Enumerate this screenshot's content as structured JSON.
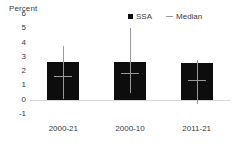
{
  "chart_data": {
    "type": "bar",
    "title": "",
    "subtitle": "",
    "xlabel": "",
    "ylabel": "Percent",
    "ylim": [
      -1,
      6
    ],
    "yticks": [
      6,
      5,
      4,
      3,
      2,
      1,
      0,
      -1
    ],
    "ytick_labels": [
      "6",
      "5",
      "4",
      "3",
      "2",
      "1",
      "0",
      "-1"
    ],
    "grid": false,
    "legend_position": "top-right",
    "categories": [
      "2000-21",
      "2000-10",
      "2011-21"
    ],
    "series": [
      {
        "name": "SSA",
        "type": "bar",
        "color": "#0d0d0d",
        "values": [
          2.65,
          2.65,
          2.55
        ]
      },
      {
        "name": "Median",
        "type": "marker",
        "color": "#9a9a9a",
        "values": [
          1.65,
          1.85,
          1.4
        ]
      }
    ],
    "error_bars": {
      "color": "#9a9a9a",
      "low": [
        0.05,
        0.45,
        -0.3
      ],
      "high": [
        3.75,
        5.05,
        2.8
      ]
    },
    "legend": [
      {
        "label": "SSA",
        "marker": "square",
        "color": "#0d0d0d"
      },
      {
        "label": "Median",
        "marker": "dash",
        "color": "#9a9a9a"
      }
    ],
    "zero_line_color": "#d9d9d9"
  }
}
